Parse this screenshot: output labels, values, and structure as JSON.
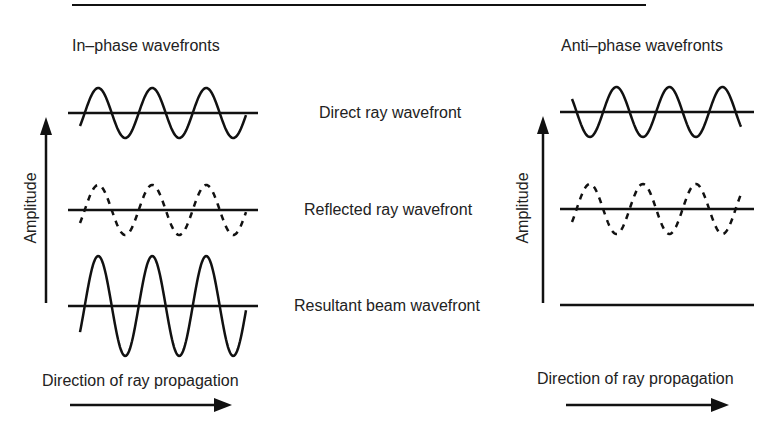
{
  "colors": {
    "stroke": "#111111",
    "text": "#222222",
    "background": "#ffffff"
  },
  "panels": {
    "left": {
      "title": "In–phase wavefronts",
      "axis_label": "Amplitude",
      "direction_label": "Direction of ray propagation"
    },
    "right": {
      "title": "Anti–phase wavefronts",
      "axis_label": "Amplitude",
      "direction_label": "Direction of ray propagation"
    }
  },
  "row_labels": [
    "Direct ray wavefront",
    "Reflected ray wavefront",
    "Resultant beam wavefront"
  ],
  "waves": {
    "left": [
      {
        "name": "direct",
        "style": "solid",
        "amplitude": 1,
        "phase": "in"
      },
      {
        "name": "reflected",
        "style": "dashed",
        "amplitude": 1,
        "phase": "in"
      },
      {
        "name": "resultant",
        "style": "solid",
        "amplitude": 2,
        "phase": "in"
      }
    ],
    "right": [
      {
        "name": "direct",
        "style": "solid",
        "amplitude": 1,
        "phase": "inverted"
      },
      {
        "name": "reflected",
        "style": "dashed",
        "amplitude": 1,
        "phase": "in"
      },
      {
        "name": "resultant",
        "style": "flat",
        "amplitude": 0,
        "phase": "cancelled"
      }
    ]
  }
}
